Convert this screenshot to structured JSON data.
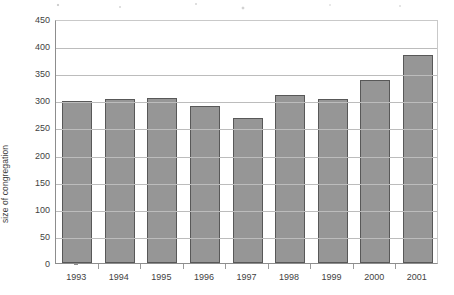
{
  "chart_data": {
    "type": "bar",
    "title": "",
    "xlabel": "",
    "ylabel": "size of congregation",
    "categories": [
      "1993",
      "1994",
      "1995",
      "1996",
      "1997",
      "1998",
      "1999",
      "2000",
      "2001"
    ],
    "values": [
      298,
      303,
      304,
      289,
      268,
      310,
      303,
      337,
      383
    ],
    "ylim": [
      0,
      450
    ],
    "ytick_labels": [
      "0",
      "50",
      "100",
      "150",
      "200",
      "250",
      "300",
      "350",
      "400",
      "450"
    ],
    "ytick_values": [
      0,
      50,
      100,
      150,
      200,
      250,
      300,
      350,
      400,
      450
    ],
    "grid": true,
    "legend": "none",
    "series": [
      {
        "name": "size of congregation",
        "values": [
          298,
          303,
          304,
          289,
          268,
          310,
          303,
          337,
          383
        ]
      }
    ],
    "colors": {
      "bar_fill": "#969696",
      "bar_border": "#585858",
      "gridline": "#bcbcbc",
      "axis": "#8d8d8d",
      "text": "#3f3f3f",
      "background": "#ffffff"
    }
  }
}
